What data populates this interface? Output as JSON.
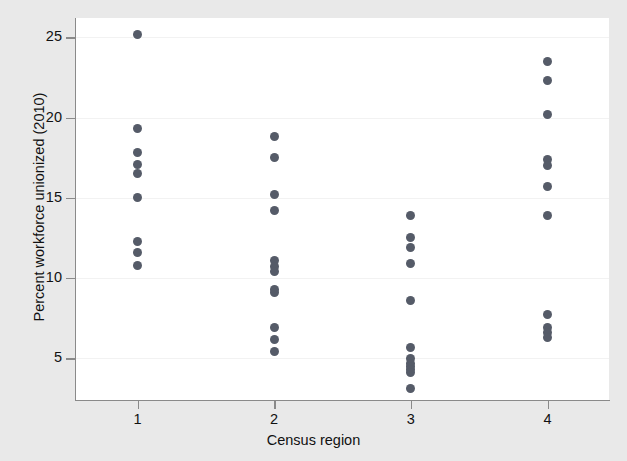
{
  "chart_data": {
    "type": "scatter",
    "title": "",
    "xlabel": "Census region",
    "ylabel": "Percent workforce unionized (2010)",
    "xlim": [
      0.55,
      4.45
    ],
    "ylim": [
      2.4,
      26.2
    ],
    "xticks": [
      1,
      2,
      3,
      4
    ],
    "xticklabels": [
      "1",
      "2",
      "3",
      "4"
    ],
    "yticks": [
      5,
      10,
      15,
      20,
      25
    ],
    "yticklabels": [
      "5",
      "10",
      "15",
      "20",
      "25"
    ],
    "grid": "horizontal",
    "legend": "none",
    "marker": "filled-circle",
    "marker_color": "#555b68",
    "plot_background": "#ffffff",
    "figure_background": "#e9e9e9",
    "axis_color": "#8a8a8a",
    "gridline_color": "#f2f2f2",
    "points": [
      {
        "x": 1,
        "y": 25.2
      },
      {
        "x": 1,
        "y": 19.3
      },
      {
        "x": 1,
        "y": 17.8
      },
      {
        "x": 1,
        "y": 17.1
      },
      {
        "x": 1,
        "y": 16.5
      },
      {
        "x": 1,
        "y": 15.0
      },
      {
        "x": 1,
        "y": 12.3
      },
      {
        "x": 1,
        "y": 11.6
      },
      {
        "x": 1,
        "y": 10.8
      },
      {
        "x": 2,
        "y": 18.8
      },
      {
        "x": 2,
        "y": 17.5
      },
      {
        "x": 2,
        "y": 15.2
      },
      {
        "x": 2,
        "y": 14.2
      },
      {
        "x": 2,
        "y": 11.1
      },
      {
        "x": 2,
        "y": 10.7
      },
      {
        "x": 2,
        "y": 10.4
      },
      {
        "x": 2,
        "y": 9.3
      },
      {
        "x": 2,
        "y": 9.1
      },
      {
        "x": 2,
        "y": 6.9
      },
      {
        "x": 2,
        "y": 6.2
      },
      {
        "x": 2,
        "y": 5.4
      },
      {
        "x": 3,
        "y": 13.9
      },
      {
        "x": 3,
        "y": 12.5
      },
      {
        "x": 3,
        "y": 11.9
      },
      {
        "x": 3,
        "y": 10.9
      },
      {
        "x": 3,
        "y": 8.6
      },
      {
        "x": 3,
        "y": 5.7
      },
      {
        "x": 3,
        "y": 5.0
      },
      {
        "x": 3,
        "y": 4.7
      },
      {
        "x": 3,
        "y": 4.5
      },
      {
        "x": 3,
        "y": 4.3
      },
      {
        "x": 3,
        "y": 4.1
      },
      {
        "x": 3,
        "y": 3.1
      },
      {
        "x": 4,
        "y": 23.5
      },
      {
        "x": 4,
        "y": 22.3
      },
      {
        "x": 4,
        "y": 20.2
      },
      {
        "x": 4,
        "y": 17.4
      },
      {
        "x": 4,
        "y": 17.0
      },
      {
        "x": 4,
        "y": 15.7
      },
      {
        "x": 4,
        "y": 13.9
      },
      {
        "x": 4,
        "y": 7.7
      },
      {
        "x": 4,
        "y": 6.9
      },
      {
        "x": 4,
        "y": 6.6
      },
      {
        "x": 4,
        "y": 6.3
      }
    ]
  }
}
